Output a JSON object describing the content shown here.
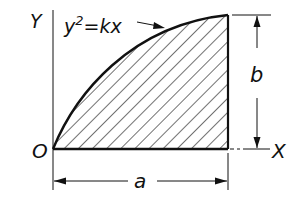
{
  "diagram": {
    "type": "parabolic-area-section",
    "labels": {
      "y_axis": "Y",
      "x_axis": "X",
      "origin": "O",
      "equation": "y² = kx",
      "equation_base": "y",
      "equation_exp": "2",
      "equation_rest": "=kx",
      "width_dim": "a",
      "height_dim": "b"
    },
    "shading": "diagonal hatch",
    "colors": {
      "ink": "#111111",
      "background": "#ffffff"
    }
  }
}
